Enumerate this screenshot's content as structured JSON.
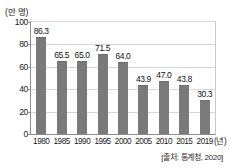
{
  "chart_data": {
    "type": "bar",
    "title": "",
    "xlabel": "(년)",
    "ylabel": "(만 명)",
    "categories": [
      "1980",
      "1985",
      "1990",
      "1995",
      "2000",
      "2005",
      "2010",
      "2015",
      "2019"
    ],
    "values": [
      86.3,
      65.5,
      65.0,
      71.5,
      64.0,
      43.9,
      47.0,
      43.8,
      30.3
    ],
    "value_labels": [
      "86.3",
      "65.5",
      "65.0",
      "71.5",
      "64.0",
      "43.9",
      "47.0",
      "43.8",
      "30.3"
    ],
    "ylim": [
      0,
      100
    ],
    "yticks": [
      0,
      20,
      40,
      60,
      80,
      100
    ],
    "ytick_labels": [
      "0",
      "20",
      "40",
      "60",
      "80",
      "100"
    ],
    "grid": true,
    "legend": "none",
    "bar_color": "#7a7a7a",
    "gridline_color": "#d6d6d6",
    "axis_color": "#8d8d8d"
  },
  "annotations": {
    "source": "[출처: 통계청, 2020]"
  }
}
